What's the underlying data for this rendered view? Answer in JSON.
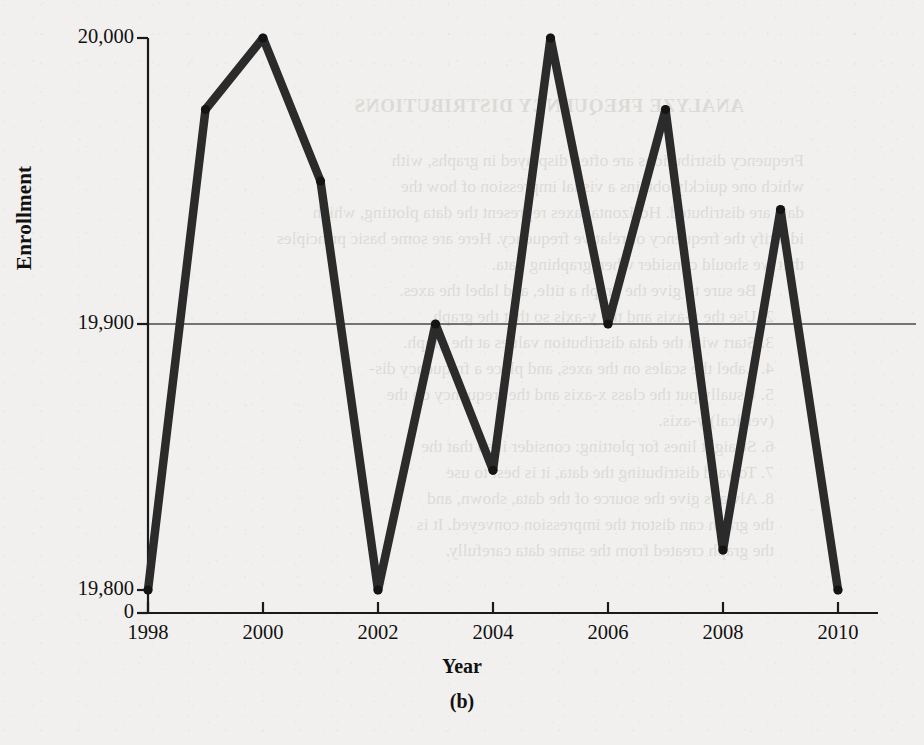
{
  "figure": {
    "subfigure_label": "(b)",
    "x_axis_title": "Year",
    "y_axis_title": "Enrollment"
  },
  "showthrough_text": {
    "heading": "ANALYZE FREQUENCY DISTRIBUTIONS",
    "lines": [
      "Frequency distributions are often displayed in graphs, with",
      "which one quickly obtains a visual impression of how the",
      "data are distributed. Horizontal axes represent the data plotting, which",
      "identify the frequency or relative frequency. Here are some basic principles",
      "that we should consider when graphing data.",
      "1. Be sure to give the graph a title, and label the axes.",
      "2. Use the x-axis and the y-axis so that the graph.",
      "3. Start with the data distribution values at the graph.",
      "4. Label the scales on the axes, and place a frequency dis-",
      "5. Usually put the class x-axis and the frequency on the",
      "   (vertical) y-axis.",
      "6. Straight lines for plotting: consider it so that the",
      "7. Toward distributing the data, it is best to use",
      "8. Always give the source of the data, shown, and",
      "   the graph can distort the impression conveyed. It is",
      "   the graph created from the same data carefully."
    ]
  },
  "chart_data": {
    "type": "line",
    "title": "",
    "xlabel": "Year",
    "ylabel": "Enrollment",
    "x": [
      1998,
      1999,
      2000,
      2001,
      2002,
      2003,
      2004,
      2005,
      2006,
      2007,
      2008,
      2009,
      2010
    ],
    "values": [
      19800,
      19975,
      20000,
      19950,
      19800,
      19900,
      19845,
      20000,
      19900,
      19975,
      19815,
      19940,
      19800
    ],
    "series": [
      {
        "name": "Enrollment",
        "values": [
          19800,
          19975,
          20000,
          19950,
          19800,
          19900,
          19845,
          20000,
          19900,
          19975,
          19815,
          19940,
          19800
        ]
      }
    ],
    "xlim": [
      1998,
      2010
    ],
    "ylim": [
      19800,
      20000
    ],
    "y_tick_labels": [
      "20,000",
      "19,900",
      "19,800",
      "0"
    ],
    "y_tick_values": [
      20000,
      19900,
      19800,
      0
    ],
    "x_tick_labels": [
      "1998",
      "2000",
      "2002",
      "2004",
      "2006",
      "2008",
      "2010"
    ],
    "x_tick_values": [
      1998,
      2000,
      2002,
      2004,
      2006,
      2008,
      2010
    ],
    "gridlines": [
      19900
    ],
    "grid": true,
    "axis_broken": true,
    "legend": "none",
    "line_color": "#2b2b2b",
    "marker": "circle",
    "marker_color": "#141414"
  }
}
